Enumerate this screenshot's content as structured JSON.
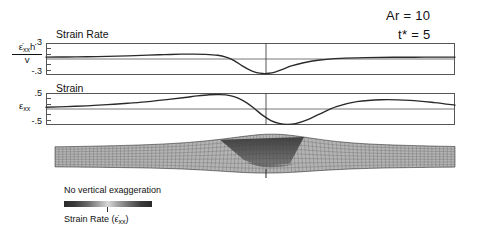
{
  "annotations": {
    "aspect_ratio": "Ar = 10",
    "time": "t* = 5",
    "aspect_ratio_value": 10,
    "time_value": 5
  },
  "panels": {
    "strain_rate": {
      "title": "Strain Rate",
      "axis_numerator": "ε̇xxh",
      "axis_denominator": "v",
      "tick_top": ".3",
      "tick_bottom": "-.3"
    },
    "strain": {
      "title": "Strain",
      "axis_label": "εxx",
      "tick_top": ".5",
      "tick_bottom": "-.5"
    }
  },
  "legend": {
    "exaggeration_note": "No vertical exaggeration",
    "colorbar_label": "Strain Rate (ε̇xx)",
    "colorbar_stops": [
      "#2b2b2b",
      "#6e6e6e",
      "#d8d8d8",
      "#6e6e6e",
      "#2b2b2b"
    ]
  },
  "mesh": {
    "description": "deformed finite element mesh with central shear wedge",
    "center_marker": "vertical tick at model center"
  },
  "chart_data": [
    {
      "type": "line",
      "title": "Strain Rate",
      "ylabel": "ε̇xx h / v",
      "xlabel": "",
      "ylim": [
        -0.3,
        0.3
      ],
      "ytick_labels": [
        ".3",
        "-.3"
      ],
      "ytick_values": [
        0.3,
        -0.3
      ],
      "grid": false,
      "zero_line": true,
      "center_line_x": 0.0,
      "x": [
        -1.0,
        -0.9,
        -0.8,
        -0.7,
        -0.6,
        -0.5,
        -0.42,
        -0.34,
        -0.28,
        -0.22,
        -0.16,
        -0.12,
        -0.08,
        -0.04,
        0.0,
        0.03,
        0.06,
        0.09,
        0.12,
        0.16,
        0.2,
        0.26,
        0.34,
        0.44,
        0.56,
        0.7,
        0.85,
        1.0
      ],
      "values": [
        0.035,
        0.038,
        0.042,
        0.05,
        0.06,
        0.072,
        0.082,
        0.09,
        0.092,
        0.088,
        0.07,
        0.035,
        -0.03,
        -0.13,
        -0.215,
        -0.255,
        -0.272,
        -0.268,
        -0.245,
        -0.19,
        -0.13,
        -0.07,
        -0.018,
        0.012,
        0.026,
        0.032,
        0.034,
        0.035
      ]
    },
    {
      "type": "line",
      "title": "Strain",
      "ylabel": "εxx",
      "xlabel": "",
      "ylim": [
        -0.5,
        0.5
      ],
      "ytick_labels": [
        ".5",
        "-.5"
      ],
      "ytick_values": [
        0.5,
        -0.5
      ],
      "grid": false,
      "zero_line": true,
      "center_line_x": 0.0,
      "x": [
        -1.0,
        -0.9,
        -0.8,
        -0.7,
        -0.6,
        -0.5,
        -0.4,
        -0.32,
        -0.26,
        -0.2,
        -0.15,
        -0.1,
        -0.06,
        -0.02,
        0.02,
        0.06,
        0.1,
        0.14,
        0.18,
        0.22,
        0.28,
        0.34,
        0.42,
        0.52,
        0.64,
        0.78,
        0.9,
        1.0
      ],
      "values": [
        0.055,
        0.075,
        0.1,
        0.135,
        0.18,
        0.23,
        0.3,
        0.36,
        0.41,
        0.445,
        0.45,
        0.42,
        0.34,
        0.2,
        0.01,
        -0.2,
        -0.36,
        -0.45,
        -0.48,
        -0.455,
        -0.33,
        -0.15,
        0.075,
        0.23,
        0.29,
        0.27,
        0.2,
        0.12
      ]
    }
  ]
}
